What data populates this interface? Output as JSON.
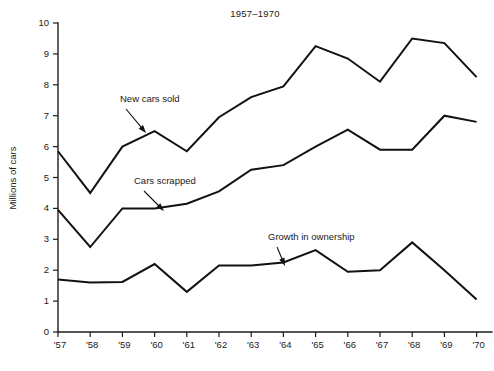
{
  "chart_data": {
    "type": "line",
    "title": "1957–1970",
    "xlabel": "",
    "ylabel": "Millions of cars",
    "x": [
      "'57",
      "'58",
      "'59",
      "'60",
      "'61",
      "'62",
      "'63",
      "'64",
      "'65",
      "'66",
      "'67",
      "'68",
      "'69",
      "'70"
    ],
    "categories": [
      "'57",
      "'58",
      "'59",
      "'60",
      "'61",
      "'62",
      "'63",
      "'64",
      "'65",
      "'66",
      "'67",
      "'68",
      "'69",
      "'70"
    ],
    "xlim": [
      0,
      13
    ],
    "ylim": [
      0,
      10
    ],
    "yticks": [
      0,
      1,
      2,
      3,
      4,
      5,
      6,
      7,
      8,
      9,
      10
    ],
    "ytick_labels": [
      "0",
      "1",
      "2",
      "3",
      "4",
      "5",
      "6",
      "7",
      "8",
      "9",
      "10"
    ],
    "grid": false,
    "legend": "none",
    "series": [
      {
        "name": "New cars sold",
        "color": "#111111",
        "values": [
          5.85,
          4.5,
          6.0,
          6.5,
          5.85,
          6.95,
          7.6,
          7.95,
          9.25,
          8.85,
          8.1,
          9.5,
          9.35,
          8.25
        ]
      },
      {
        "name": "Cars scrapped",
        "color": "#111111",
        "values": [
          3.95,
          2.75,
          4.0,
          4.0,
          4.15,
          4.55,
          5.25,
          5.4,
          6.0,
          6.55,
          5.9,
          5.9,
          7.0,
          6.8
        ]
      },
      {
        "name": "Growth in ownership",
        "color": "#111111",
        "values": [
          1.7,
          1.6,
          1.62,
          2.2,
          1.3,
          2.15,
          2.15,
          2.25,
          2.65,
          1.95,
          2.0,
          2.9,
          2.0,
          1.05
        ]
      }
    ],
    "annotations": [
      {
        "text": "New cars sold",
        "label_x": 120,
        "label_y": 102,
        "arrow_from_x": 126,
        "arrow_from_y": 109,
        "arrow_to_x": 146,
        "arrow_to_y": 133
      },
      {
        "text": "Cars scrapped",
        "label_x": 134,
        "label_y": 184,
        "arrow_from_x": 144,
        "arrow_from_y": 191,
        "arrow_to_x": 164,
        "arrow_to_y": 211
      },
      {
        "text": "Growth in ownership",
        "label_x": 268,
        "label_y": 240,
        "arrow_from_x": 277,
        "arrow_from_y": 247,
        "arrow_to_x": 285,
        "arrow_to_y": 266
      }
    ]
  },
  "plot_geometry": {
    "x_origin": 58,
    "x_step": 32.2,
    "y_zero": 332,
    "y_unit": 30.9,
    "x_axis_right": 492,
    "tick_len": 5
  }
}
